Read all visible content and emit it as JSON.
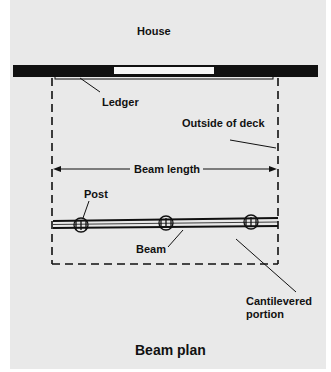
{
  "diagram": {
    "title": "Beam plan",
    "labels": {
      "house": "House",
      "ledger": "Ledger",
      "outside_of_deck": "Outside of deck",
      "beam_length": "Beam length",
      "post": "Post",
      "beam": "Beam",
      "cantilevered_line1": "Cantilevered",
      "cantilevered_line2": "portion"
    },
    "colors": {
      "background": "#e9e9e9",
      "page": "#ffffff",
      "ink": "#111111"
    },
    "post_count": 3
  }
}
